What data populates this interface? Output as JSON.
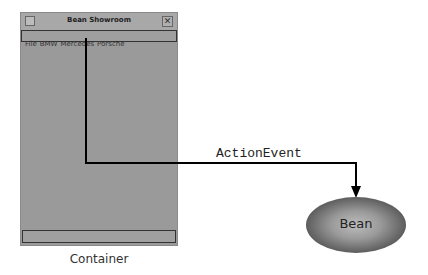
{
  "window": {
    "title": "Bean Showroom",
    "menu": [
      "File",
      "BMW",
      "Mercedes",
      "Porsche"
    ],
    "close_glyph": "✕"
  },
  "labels": {
    "container": "Container",
    "event": "ActionEvent",
    "bean": "Bean"
  },
  "colors": {
    "window_bg": "#9a9a9a",
    "line": "#000000"
  }
}
